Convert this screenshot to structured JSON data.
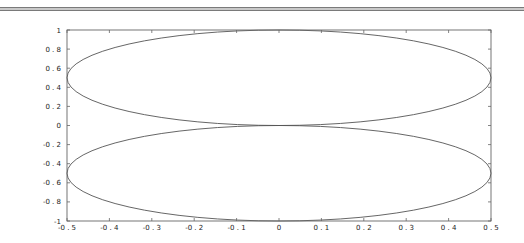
{
  "chart_data": {
    "type": "line",
    "title": "",
    "xlabel": "",
    "ylabel": "",
    "xlim": [
      -0.5,
      0.5
    ],
    "ylim": [
      -1,
      1
    ],
    "grid": false,
    "legend": null,
    "x_ticks": [
      "-0.5",
      "-0.4",
      "-0.3",
      "-0.2",
      "-0.1",
      "0",
      "0.1",
      "0.2",
      "0.3",
      "0.4",
      "0.5"
    ],
    "y_ticks": [
      "1",
      "0.8",
      "0.6",
      "0.4",
      "0.2",
      "0",
      "-0.2",
      "-0.4",
      "-0.6",
      "-0.8",
      "-1"
    ],
    "series": [
      {
        "name": "upper ellipse",
        "shape": "ellipse",
        "center": [
          0,
          0.5
        ],
        "semi_axes": [
          0.5,
          0.5
        ],
        "color": "#555555"
      },
      {
        "name": "lower ellipse",
        "shape": "ellipse",
        "center": [
          0,
          -0.5
        ],
        "semi_axes": [
          0.5,
          0.5
        ],
        "color": "#555555"
      }
    ]
  },
  "frame": {
    "axis_color": "#666666",
    "line_color": "#555555"
  }
}
